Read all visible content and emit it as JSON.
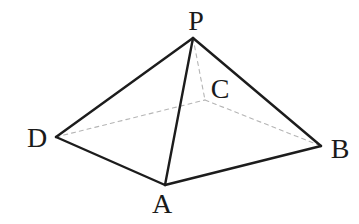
{
  "diagram": {
    "type": "geometry-solid",
    "figure_name": "pyramid P-ABCD",
    "background_color": "#ffffff",
    "solid_edge_color": "#1c1c1c",
    "solid_edge_width": 2.4,
    "dashed_edge_color": "#b5b5b5",
    "dashed_edge_width": 1.1,
    "dash_pattern": "4 4",
    "label_color": "#1a1a1a",
    "label_font_size": 28,
    "canvas": {
      "width": 359,
      "height": 224
    },
    "vertices": {
      "P": {
        "x": 193,
        "y": 38,
        "label": "P",
        "label_x": 196,
        "label_y": 30
      },
      "A": {
        "x": 165,
        "y": 185,
        "label": "A",
        "label_x": 162,
        "label_y": 213
      },
      "B": {
        "x": 321,
        "y": 146,
        "label": "B",
        "label_x": 340,
        "label_y": 158
      },
      "C": {
        "x": 205,
        "y": 100,
        "label": "C",
        "label_x": 220,
        "label_y": 98
      },
      "D": {
        "x": 56,
        "y": 137,
        "label": "D",
        "label_x": 37,
        "label_y": 147
      }
    },
    "solid_edges": [
      [
        "P",
        "D"
      ],
      [
        "P",
        "A"
      ],
      [
        "P",
        "B"
      ],
      [
        "D",
        "A"
      ],
      [
        "A",
        "B"
      ]
    ],
    "dashed_edges": [
      [
        "P",
        "C"
      ],
      [
        "D",
        "C"
      ],
      [
        "C",
        "B"
      ]
    ]
  }
}
